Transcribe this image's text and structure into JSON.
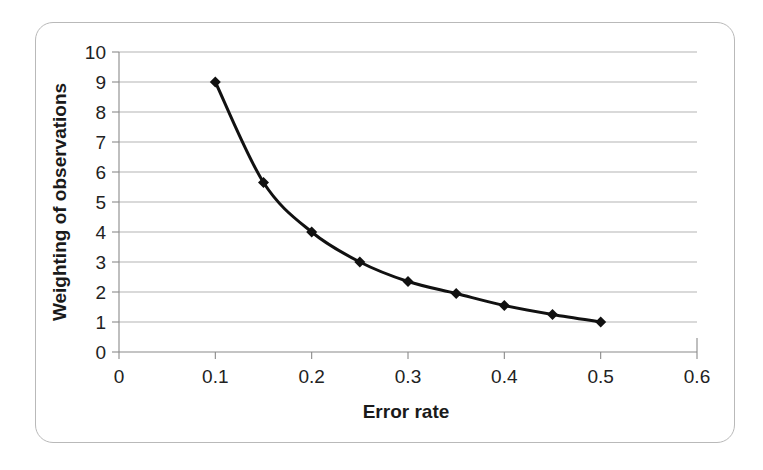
{
  "figure": {
    "frame": {
      "border_color": "#b9b9b9",
      "background": "#ffffff"
    }
  },
  "chart_data": {
    "type": "line",
    "title": "",
    "subtitle": "",
    "xlabel": "Error rate",
    "ylabel": "Weighting of observations",
    "xlim": [
      0,
      0.6
    ],
    "ylim": [
      0,
      10
    ],
    "xticks": [
      "0",
      "0.1",
      "0.2",
      "0.3",
      "0.4",
      "0.5",
      "0.6"
    ],
    "xtick_values": [
      0,
      0.1,
      0.2,
      0.3,
      0.4,
      0.5,
      0.6
    ],
    "yticks": [
      "0",
      "1",
      "2",
      "3",
      "4",
      "5",
      "6",
      "7",
      "8",
      "9",
      "10"
    ],
    "ytick_values": [
      0,
      1,
      2,
      3,
      4,
      5,
      6,
      7,
      8,
      9,
      10
    ],
    "grid": {
      "horizontal": true,
      "vertical": false,
      "color": "#aaaaaa"
    },
    "legend": {
      "visible": false,
      "position": "none"
    },
    "annotations": [],
    "series": [
      {
        "name": "Weighting",
        "marker": "diamond",
        "marker_color": "#111111",
        "line_color": "#111111",
        "line_width": 3,
        "x": [
          0.1,
          0.15,
          0.2,
          0.25,
          0.3,
          0.35,
          0.4,
          0.45,
          0.5
        ],
        "values": [
          9.0,
          5.65,
          4.0,
          3.0,
          2.35,
          1.95,
          1.55,
          1.25,
          1.0
        ]
      }
    ]
  }
}
